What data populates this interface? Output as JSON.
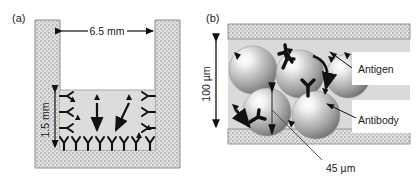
{
  "figure": {
    "panels": [
      {
        "id": "a",
        "label": "(a)",
        "name": "well-cross-section",
        "dimensions": [
          {
            "name": "well-width",
            "value": "6.5 mm",
            "orientation": "horizontal"
          },
          {
            "name": "fluid-depth",
            "value": "1.5 mm",
            "orientation": "vertical"
          }
        ],
        "elements": {
          "antibody_count_bottom": 8,
          "antibody_count_left_wall": 3,
          "antibody_count_right_wall": 3,
          "antigen_count": 6,
          "motion_arrows": 2
        }
      },
      {
        "id": "b",
        "label": "(b)",
        "name": "bead-packed-channel",
        "dimensions": [
          {
            "name": "channel-height",
            "value": "100 µm",
            "orientation": "vertical"
          },
          {
            "name": "bead-diameter",
            "value": "45 µm",
            "orientation": "leader"
          }
        ],
        "callouts": [
          {
            "name": "antigen-callout",
            "label": "Antigen"
          },
          {
            "name": "antibody-callout",
            "label": "Antibody"
          }
        ],
        "elements": {
          "bead_count": 5,
          "antibody_count": 4,
          "antigen_count": 7,
          "motion_arrows": 3
        }
      }
    ],
    "colors": {
      "wall_fill": "#d8d8d8",
      "wall_stroke": "#8a8a8a",
      "fluid_fill": "#dcdcdc",
      "lumen_fill": "#dadada",
      "bead_light": "#fbfbfb",
      "bead_mid": "#b4b4b4",
      "bead_dark": "#7c7c7c",
      "ink": "#111111",
      "background": "#ffffff"
    }
  }
}
